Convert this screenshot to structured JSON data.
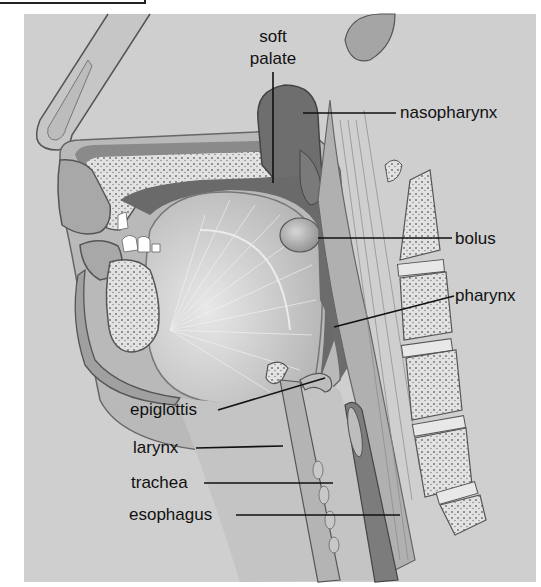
{
  "figure": {
    "labels": {
      "soft_palate_line1": "soft",
      "soft_palate_line2": "palate",
      "nasopharynx": "nasopharynx",
      "bolus": "bolus",
      "pharynx": "pharynx",
      "epiglottis": "epiglottis",
      "larynx": "larynx",
      "trachea": "trachea",
      "esophagus": "esophagus"
    },
    "colors": {
      "background_panel": "#cfcfcf",
      "dark_cavity": "#6e6e6e",
      "tissue": "#b8b8b8",
      "bone": "#e4e4e4",
      "label_text": "#111111",
      "leader_line": "#111111"
    }
  }
}
